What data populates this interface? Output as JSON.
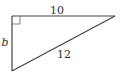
{
  "diagram": {
    "type": "right-triangle",
    "labels": {
      "top_side": "10",
      "left_side": "b",
      "hypotenuse": "12"
    },
    "stroke_color": "#444444",
    "vertices": {
      "right_angle": [
        12,
        16
      ],
      "top_right": [
        115,
        16
      ],
      "bottom_left": [
        12,
        71
      ]
    },
    "right_angle_marker": true
  }
}
